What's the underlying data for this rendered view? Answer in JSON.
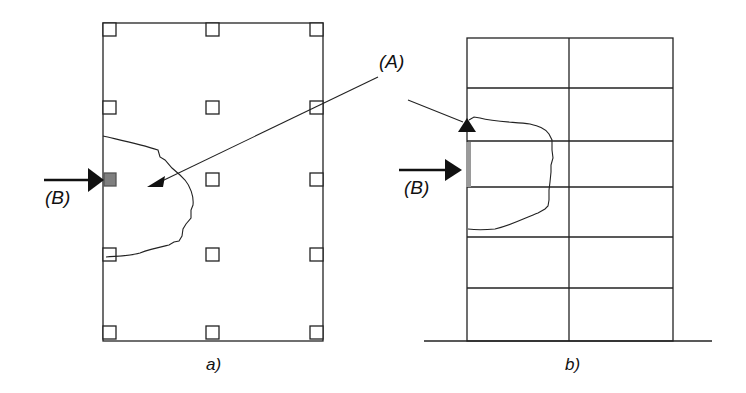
{
  "diagram": {
    "labels": {
      "A": "(A)",
      "B_left": "(B)",
      "B_right": "(B)",
      "caption_a": "a)",
      "caption_b": "b)"
    },
    "panel_a": {
      "description": "Plan view: rectangular slab with column squares in 3 columns x 5 rows; gray square indicates removed column (B); irregular curve marks affected region (A)",
      "columns": 3,
      "rows": 5,
      "removed_column": {
        "column": 1,
        "row": 3,
        "color": "#7f7f7f"
      }
    },
    "panel_b": {
      "description": "Elevation view: 2-bay, 6-storey frame on ground line; gray segment indicates removed column (B) at third storey from top; irregular curve marks affected region (A)",
      "bays": 2,
      "storeys": 6,
      "removed_segment_color": "#9a9a9a"
    },
    "colors": {
      "line": "#222222",
      "removed_square": "#7f7f7f",
      "removed_bar": "#9a9a9a",
      "background": "#ffffff"
    }
  }
}
